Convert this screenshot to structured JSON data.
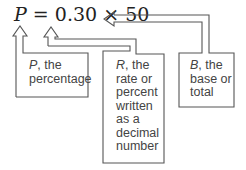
{
  "equation": {
    "variable": "P",
    "equals": "=",
    "rate": "0.30",
    "times": "×",
    "base": "50"
  },
  "labels": {
    "percentage": {
      "var": "P",
      "lines": [
        ", the",
        "percentage"
      ]
    },
    "rate": {
      "var": "R",
      "lines": [
        ", the",
        "rate or",
        "percent",
        "written",
        "as a",
        "decimal",
        "number"
      ]
    },
    "base": {
      "var": "B",
      "lines": [
        ", the",
        "base or",
        "total"
      ]
    }
  },
  "colors": {
    "line": "#555555",
    "text": "#444444"
  }
}
